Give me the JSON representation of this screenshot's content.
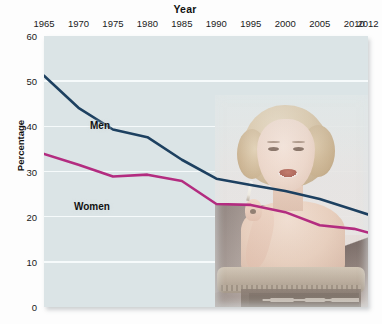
{
  "chart_data": {
    "type": "line",
    "title": "Year",
    "xlabel": "Year",
    "ylabel": "Percentage",
    "x": [
      1965,
      1970,
      1975,
      1980,
      1985,
      1990,
      1995,
      2000,
      2005,
      2010,
      2012
    ],
    "xtick_labels": [
      "1965",
      "1970",
      "1975",
      "1980",
      "1985",
      "1990",
      "1995",
      "2000",
      "2005",
      "2010",
      "2012"
    ],
    "ytick_labels": [
      "0",
      "10",
      "20",
      "30",
      "40",
      "50",
      "60"
    ],
    "yticks": [
      0,
      10,
      20,
      30,
      40,
      50,
      60
    ],
    "ylim": [
      0,
      60
    ],
    "xlim": [
      1965,
      2012
    ],
    "grid": "horizontal-white",
    "legend": "inline-labels",
    "plot_background": "#dbe4e6",
    "series": [
      {
        "name": "Men",
        "color": "#1d4060",
        "label_position": "inline",
        "values": [
          51.2,
          44.1,
          39.3,
          37.6,
          32.6,
          28.4,
          27.0,
          25.7,
          23.9,
          21.5,
          20.5
        ]
      },
      {
        "name": "Women",
        "color": "#b32c80",
        "label_position": "inline",
        "values": [
          33.9,
          31.5,
          28.9,
          29.3,
          27.9,
          22.8,
          22.6,
          21.0,
          18.1,
          17.3,
          16.5
        ]
      }
    ],
    "annotations": [
      {
        "type": "photo",
        "name": "vintage-woman-smoking-photo",
        "description": "Vintage sepia photograph of a smiling woman holding a cigarette, seated by an ottoman"
      }
    ]
  },
  "labels": {
    "title": "Year",
    "ylabel": "Percentage",
    "men": "Men",
    "women": "Women"
  }
}
